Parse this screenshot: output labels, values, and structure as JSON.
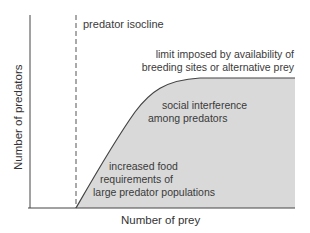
{
  "diagram": {
    "x_axis_label": "Number of prey",
    "y_axis_label": "Number of predators",
    "isocline_label": "predator isocline",
    "annotations": {
      "limit_line1": "limit imposed by availability of",
      "limit_line2": "breeding sites or alternative prey",
      "social_line1": "social interference",
      "social_line2": "among predators",
      "food_line1": "increased food",
      "food_line2": "requirements of",
      "food_line3": "large predator populations"
    },
    "colors": {
      "fill": "#d9d9d9",
      "line": "#444444"
    }
  }
}
